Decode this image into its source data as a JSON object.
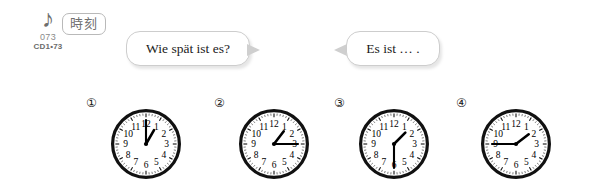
{
  "audio": {
    "note_icon": "music-note-icon",
    "note_glyph": "♪",
    "track_number": "073",
    "cd_label": "CD1•73"
  },
  "topic": {
    "badge_label": "時刻"
  },
  "bubbles": [
    {
      "id": "question",
      "text": "Wie spät ist es?",
      "tail": "right"
    },
    {
      "id": "answer",
      "text": "Es ist … .",
      "tail": "left"
    }
  ],
  "clocks": [
    {
      "index_label": "①",
      "time": "1:00",
      "hour": 1,
      "minute": 0
    },
    {
      "index_label": "②",
      "time": "1:15",
      "hour": 1,
      "minute": 15
    },
    {
      "index_label": "③",
      "time": "1:30",
      "hour": 1,
      "minute": 30
    },
    {
      "index_label": "④",
      "time": "1:45",
      "hour": 1,
      "minute": 45
    }
  ],
  "clock_face": {
    "numerals": [
      "12",
      "1",
      "2",
      "3",
      "4",
      "5",
      "6",
      "7",
      "8",
      "9",
      "10",
      "11"
    ],
    "rim_color": "#111111",
    "dial_color": "#ffffff",
    "hand_color": "#000000"
  }
}
